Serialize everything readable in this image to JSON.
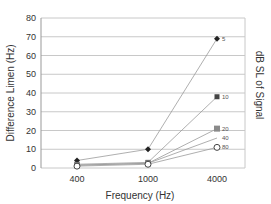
{
  "chart_data": {
    "type": "line",
    "title": "",
    "xlabel": "Frequency (Hz)",
    "ylabel": "Difference Limen (Hz)",
    "right_label": "dB SL of Signal",
    "categories": [
      "400",
      "1000",
      "4000"
    ],
    "ylim": [
      0,
      80
    ],
    "yticks": [
      0,
      10,
      20,
      30,
      40,
      50,
      60,
      70,
      80
    ],
    "grid": true,
    "legend_position": "inline-right",
    "series": [
      {
        "name": "5",
        "marker": "diamond",
        "values": [
          4,
          10,
          69
        ]
      },
      {
        "name": "10",
        "marker": "square",
        "values": [
          2,
          3,
          38
        ]
      },
      {
        "name": "20",
        "marker": "square-gray",
        "values": [
          1.5,
          2.5,
          21
        ]
      },
      {
        "name": "40",
        "marker": "none",
        "values": [
          1.5,
          2.5,
          16
        ]
      },
      {
        "name": "80",
        "marker": "circle-open",
        "values": [
          1,
          2,
          11
        ]
      }
    ]
  },
  "colors": {
    "gridline": "#c8c8c8",
    "line": "#9a9a9a",
    "marker_dark": "#222222",
    "marker_gray": "#8a8a8a"
  }
}
